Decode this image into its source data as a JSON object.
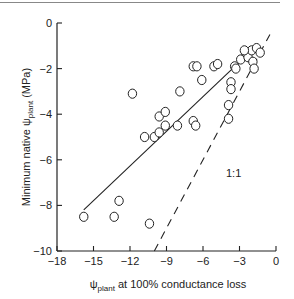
{
  "chart_data": {
    "type": "scatter",
    "title": "",
    "xlabel": "ψplant at 100% conductance loss",
    "xlabel_main": "ψ",
    "xlabel_sub": "plant",
    "xlabel_rest": " at 100% conductance loss",
    "ylabel": "Minimum native ψplant (MPa)",
    "ylabel_pre": "Minimum native ψ",
    "ylabel_sub": "plant",
    "ylabel_post": " (MPa)",
    "xlim": [
      -18,
      0
    ],
    "ylim": [
      -10,
      0
    ],
    "xticks": [
      -18,
      -15,
      -12,
      -9,
      -6,
      -3,
      0
    ],
    "yticks": [
      0,
      -2,
      -4,
      -6,
      -8,
      -10
    ],
    "xtick_labels": [
      "−18",
      "−15",
      "−12",
      "−9",
      "−6",
      "−3",
      "0"
    ],
    "ytick_labels": [
      "0",
      "−2",
      "−4",
      "−6",
      "−8",
      "−10"
    ],
    "grid": false,
    "annotation": "1:1",
    "points": [
      [
        -15.8,
        -8.5
      ],
      [
        -13.3,
        -8.5
      ],
      [
        -12.9,
        -7.8
      ],
      [
        -11.8,
        -3.1
      ],
      [
        -10.4,
        -8.8
      ],
      [
        -10.8,
        -5.0
      ],
      [
        -10.0,
        -5.0
      ],
      [
        -9.6,
        -4.8
      ],
      [
        -9.6,
        -4.1
      ],
      [
        -9.1,
        -3.9
      ],
      [
        -9.1,
        -4.5
      ],
      [
        -8.1,
        -4.5
      ],
      [
        -7.9,
        -3.0
      ],
      [
        -6.8,
        -4.3
      ],
      [
        -6.6,
        -4.5
      ],
      [
        -6.8,
        -1.9
      ],
      [
        -6.5,
        -1.9
      ],
      [
        -6.1,
        -2.5
      ],
      [
        -5.1,
        -1.9
      ],
      [
        -4.8,
        -1.8
      ],
      [
        -3.9,
        -3.6
      ],
      [
        -3.9,
        -4.2
      ],
      [
        -3.7,
        -2.6
      ],
      [
        -3.7,
        -2.9
      ],
      [
        -3.4,
        -1.9
      ],
      [
        -3.3,
        -2.0
      ],
      [
        -2.9,
        -1.6
      ],
      [
        -2.5,
        -1.3
      ],
      [
        -2.3,
        -1.5
      ],
      [
        -2.0,
        -1.2
      ],
      [
        -1.9,
        -1.7
      ],
      [
        -1.8,
        -2.0
      ],
      [
        -1.6,
        -1.1
      ],
      [
        -1.3,
        -1.3
      ],
      [
        -2.6,
        -1.2
      ]
    ],
    "regression_line": {
      "x": [
        -15.8,
        -1.8
      ],
      "y": [
        -8.2,
        -1.1
      ],
      "style": "solid"
    },
    "identity_line": {
      "x": [
        -10,
        -0.5
      ],
      "y": [
        -10,
        -0.5
      ],
      "style": "dashed",
      "label": "1:1"
    }
  }
}
